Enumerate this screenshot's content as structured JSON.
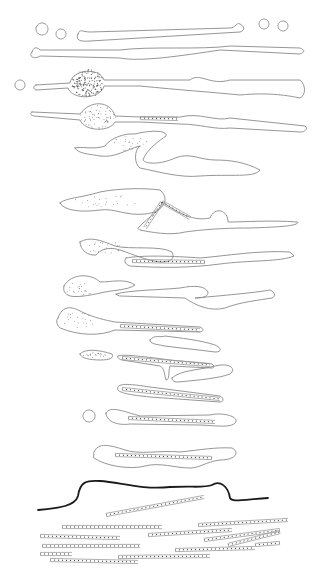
{
  "figure": {
    "background": "#ffffff",
    "stroke_color": "#8a8a8a",
    "dark_line_color": "#1a1a1a"
  },
  "circles": [
    {
      "cx": 42,
      "cy": 29,
      "r": 6
    },
    {
      "cx": 61,
      "cy": 34,
      "r": 5
    },
    {
      "cx": 264,
      "cy": 24,
      "r": 5
    },
    {
      "cx": 283,
      "cy": 26,
      "r": 5
    },
    {
      "cx": 20,
      "cy": 85,
      "r": 5
    },
    {
      "cx": 89,
      "cy": 416,
      "r": 6
    }
  ],
  "outlines": [
    "M78,34 C75,40 80,42 90,41 L240,32 C246,30 244,26 240,24 C236,22 236,28 230,28 L90,32 C82,32 80,28 78,34 Z",
    "M32,52 C28,56 34,60 40,56 L120,58 C140,62 180,56 220,50 L300,54 C305,52 305,50 300,48 L230,46 C200,50 150,46 120,50 L40,50 C36,46 33,48 32,52 Z",
    "M36,85 L70,83 C72,70 98,66 104,80 L190,80 C200,72 210,86 230,80 L300,80 C306,85 306,95 300,98 C290,96 270,92 240,95 C210,92 180,90 140,86 L104,86 C100,100 72,100 68,88 L36,90 C33,89 33,86 36,85 Z",
    "M32,112 L80,114 C90,100 110,100 115,116 L140,117 L180,117 C200,112 215,122 230,118 L305,126 C308,128 306,132 300,132 L230,128 C215,130 200,124 180,124 L140,122 L115,122 C110,132 85,132 80,120 L34,116 C30,115 30,113 32,112 Z",
    "M75,148 C80,146 95,150 105,146 C110,138 125,133 135,134 C150,130 168,130 166,136 C160,140 146,150 143,160 C145,164 160,165 175,158 C190,152 200,160 215,160 C230,160 245,162 260,170 C255,178 230,174 200,176 C180,178 160,172 140,168 C134,164 134,150 140,146 C125,150 115,158 100,156 C90,154 78,154 75,148 Z",
    "M60,203 C65,198 80,198 100,192 C120,188 145,188 160,190 C170,198 165,212 145,214 C125,216 115,208 100,210 C85,212 65,212 60,203 Z",
    "M138,228 C150,215 160,212 162,202 C175,210 190,222 210,218 C215,206 228,210 228,222 C245,222 270,220 298,222 C298,226 280,227 250,228 C220,228 200,230 185,232 C170,236 150,232 140,230 Z",
    "M80,242 C90,236 100,240 115,246 C130,250 160,245 172,252 C175,258 172,262 160,262 C145,260 135,255 120,250 C108,246 100,250 96,255 C88,256 80,250 80,242 Z",
    "M126,258 C140,255 175,256 200,258 C225,256 260,250 290,252 L294,256 C280,262 250,260 220,264 C190,268 160,268 130,266 C124,264 124,260 126,258 Z",
    "M64,286 C72,272 92,274 100,282 C112,282 125,278 135,285 C128,290 115,290 105,292 C95,294 80,298 70,296 C64,294 63,290 64,286 Z",
    "M116,294 C130,290 160,290 180,288 C195,285 205,286 208,292 C208,296 205,298 195,298 C230,295 260,292 270,290 C275,292 276,296 272,298 C260,300 240,302 225,308 C210,312 195,305 185,298 L120,296 Z",
    "M58,318 C62,305 72,306 82,312 C95,318 105,320 115,322 L200,327 C204,329 204,331 200,332 L115,330 C100,336 80,336 60,328 C56,324 56,320 58,318 Z",
    "M150,340 C155,334 160,338 165,336 C180,338 200,340 215,345 C222,348 222,352 215,352 C200,350 180,348 165,346 C155,344 150,344 150,340 Z",
    "M80,354 C85,348 100,350 112,354 C114,358 110,360 100,360 C90,360 80,358 80,354 Z",
    "M118,356 C122,354 140,356 170,360 L212,364 C215,366 214,368 212,368 L170,366 C168,372 170,380 166,380 C164,372 164,368 160,366 L122,360 C118,359 117,357 118,356 Z",
    "M172,378 C180,370 200,370 215,366 C232,362 236,370 230,374 C220,378 200,380 178,382 C173,382 172,380 172,378 Z",
    "M118,387 C120,383 130,384 150,387 L220,396 C224,398 224,402 220,402 L150,397 C130,395 120,393 118,390 Z",
    "M106,413 C110,405 125,412 140,416 L210,415 C222,412 238,416 236,422 C232,428 220,426 200,425 L130,424 C115,426 106,420 106,413 Z",
    "M94,452 C98,442 110,445 125,450 C140,455 160,450 180,452 C200,450 215,447 232,448 C240,452 236,460 220,460 C205,462 200,468 190,468 C175,468 160,462 145,466 C130,470 105,466 94,458 Z"
  ],
  "dark_boundary": "M38,510 C60,508 75,506 78,496 C80,482 86,480 100,481 C120,482 140,490 170,487 C195,486 205,488 212,485 C220,480 228,486 230,498 C232,502 240,500 268,498",
  "dotted_rods": [
    {
      "x1": 140,
      "y1": 118,
      "x2": 178,
      "y2": 119
    },
    {
      "x1": 162,
      "y1": 202,
      "x2": 145,
      "y2": 228
    },
    {
      "x1": 162,
      "y1": 202,
      "x2": 190,
      "y2": 218
    },
    {
      "x1": 132,
      "y1": 261,
      "x2": 205,
      "y2": 262
    },
    {
      "x1": 120,
      "y1": 326,
      "x2": 200,
      "y2": 330
    },
    {
      "x1": 122,
      "y1": 358,
      "x2": 210,
      "y2": 365
    },
    {
      "x1": 122,
      "y1": 389,
      "x2": 220,
      "y2": 399
    },
    {
      "x1": 128,
      "y1": 418,
      "x2": 215,
      "y2": 422
    },
    {
      "x1": 115,
      "y1": 455,
      "x2": 212,
      "y2": 458
    },
    {
      "x1": 106,
      "y1": 515,
      "x2": 204,
      "y2": 497
    },
    {
      "x1": 62,
      "y1": 527,
      "x2": 162,
      "y2": 527
    },
    {
      "x1": 40,
      "y1": 536,
      "x2": 120,
      "y2": 538
    },
    {
      "x1": 42,
      "y1": 546,
      "x2": 140,
      "y2": 546
    },
    {
      "x1": 40,
      "y1": 554,
      "x2": 72,
      "y2": 554
    },
    {
      "x1": 50,
      "y1": 560,
      "x2": 138,
      "y2": 562
    },
    {
      "x1": 118,
      "y1": 557,
      "x2": 210,
      "y2": 556
    },
    {
      "x1": 148,
      "y1": 535,
      "x2": 232,
      "y2": 530
    },
    {
      "x1": 175,
      "y1": 550,
      "x2": 255,
      "y2": 548
    },
    {
      "x1": 198,
      "y1": 525,
      "x2": 288,
      "y2": 520
    },
    {
      "x1": 204,
      "y1": 540,
      "x2": 280,
      "y2": 530
    },
    {
      "x1": 228,
      "y1": 545,
      "x2": 280,
      "y2": 532
    },
    {
      "x1": 255,
      "y1": 545,
      "x2": 280,
      "y2": 543
    }
  ],
  "stippled_regions": [
    {
      "cx": 88,
      "cy": 83,
      "rx": 16,
      "ry": 14,
      "density": "dense"
    },
    {
      "cx": 98,
      "cy": 117,
      "rx": 18,
      "ry": 12,
      "density": "medium"
    },
    {
      "cx": 130,
      "cy": 143,
      "rx": 18,
      "ry": 8,
      "density": "light"
    },
    {
      "cx": 105,
      "cy": 202,
      "rx": 35,
      "ry": 7,
      "density": "light"
    },
    {
      "cx": 105,
      "cy": 248,
      "rx": 20,
      "ry": 6,
      "density": "light"
    },
    {
      "cx": 80,
      "cy": 289,
      "rx": 15,
      "ry": 7,
      "density": "light"
    },
    {
      "cx": 80,
      "cy": 320,
      "rx": 18,
      "ry": 8,
      "density": "light"
    },
    {
      "cx": 95,
      "cy": 355,
      "rx": 12,
      "ry": 3,
      "density": "light"
    }
  ]
}
